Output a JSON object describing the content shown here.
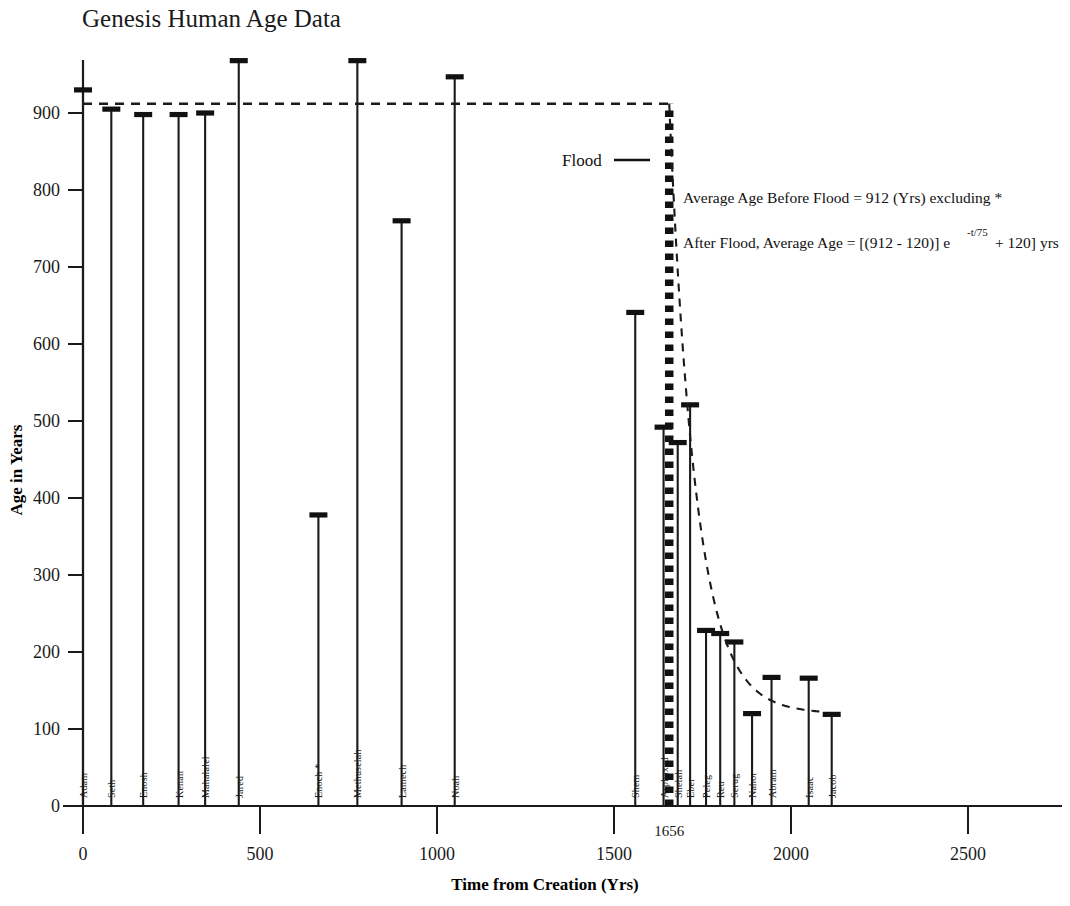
{
  "chart_data": {
    "type": "bar",
    "title": "Genesis Human Age Data",
    "xlabel": "Time from Creation (Yrs)",
    "ylabel": "Age in Years",
    "xlim": [
      0,
      2700
    ],
    "ylim": [
      0,
      1000
    ],
    "grid": false,
    "legend": "none",
    "x_ticks": [
      0,
      500,
      1000,
      1500,
      2000,
      2500
    ],
    "x_tick_labels": [
      "0",
      "500",
      "1000",
      "1500",
      "2000",
      "2500"
    ],
    "x_special_tick": {
      "value": 1656,
      "label": "1656"
    },
    "y_ticks": [
      0,
      100,
      200,
      300,
      400,
      500,
      600,
      700,
      800,
      900
    ],
    "y_tick_labels": [
      "0",
      "100",
      "200",
      "300",
      "400",
      "500",
      "600",
      "700",
      "800",
      "900"
    ],
    "categories": [
      "Adam",
      "Seth",
      "Enosh",
      "Kenan",
      "Mahalalel",
      "Jared",
      "Enoch *",
      "Methuselah",
      "Lamech",
      "Noah",
      "Shem",
      "Arphaxad",
      "Shelah",
      "Eber",
      "Peleg",
      "Reu",
      "Serug",
      "Nahor",
      "Abram",
      "Isaac",
      "Jacob"
    ],
    "values": [
      930,
      905,
      898,
      898,
      900,
      968,
      378,
      968,
      760,
      947,
      641,
      492,
      472,
      521,
      228,
      224,
      213,
      120,
      167,
      166,
      119
    ],
    "x": [
      0,
      80,
      170,
      270,
      345,
      440,
      665,
      775,
      900,
      1050,
      1560,
      1640,
      1680,
      1715,
      1760,
      1800,
      1840,
      1890,
      1945,
      2050,
      2115
    ],
    "points": [
      {
        "name": "Adam",
        "x": 0,
        "age": 930
      },
      {
        "name": "Seth",
        "x": 80,
        "age": 905
      },
      {
        "name": "Enosh",
        "x": 170,
        "age": 898
      },
      {
        "name": "Kenan",
        "x": 270,
        "age": 898
      },
      {
        "name": "Mahalalel",
        "x": 345,
        "age": 900
      },
      {
        "name": "Jared",
        "x": 440,
        "age": 968
      },
      {
        "name": "Enoch *",
        "x": 665,
        "age": 378
      },
      {
        "name": "Methuselah",
        "x": 775,
        "age": 968
      },
      {
        "name": "Lamech",
        "x": 900,
        "age": 760
      },
      {
        "name": "Noah",
        "x": 1050,
        "age": 947
      },
      {
        "name": "Shem",
        "x": 1560,
        "age": 641
      },
      {
        "name": "Arphaxad",
        "x": 1640,
        "age": 492
      },
      {
        "name": "Shelah",
        "x": 1680,
        "age": 472
      },
      {
        "name": "Eber",
        "x": 1715,
        "age": 521
      },
      {
        "name": "Peleg",
        "x": 1760,
        "age": 228
      },
      {
        "name": "Reu",
        "x": 1800,
        "age": 224
      },
      {
        "name": "Serug",
        "x": 1840,
        "age": 213
      },
      {
        "name": "Nahor",
        "x": 1890,
        "age": 120
      },
      {
        "name": "Abram",
        "x": 1945,
        "age": 167
      },
      {
        "name": "Isaac",
        "x": 2050,
        "age": 166
      },
      {
        "name": "Jacob",
        "x": 2115,
        "age": 119
      }
    ],
    "reference_lines": [
      {
        "name": "average-age-before-flood",
        "orientation": "horizontal",
        "value": 912,
        "style": "dashed",
        "x_from": 0,
        "x_to": 1656
      },
      {
        "name": "flood-line",
        "orientation": "vertical",
        "value": 1656,
        "style": "thick-dotted",
        "y_from": 0,
        "y_to": 912
      }
    ],
    "curve": {
      "name": "post-flood-decay",
      "formula": "(912 - 120) * exp(-t/75) + 120",
      "style": "dashed",
      "t_start": 1656,
      "t_end": 2100
    },
    "annotations": [
      {
        "name": "flood-label",
        "text": "Flood"
      },
      {
        "name": "avg-before-flood-note",
        "text": "Average Age Before Flood = 912 (Yrs) excluding *"
      },
      {
        "name": "after-flood-formula-part1",
        "text": "After Flood, Average Age = [(912 - 120)] e"
      },
      {
        "name": "after-flood-formula-exponent",
        "text": "-t/75"
      },
      {
        "name": "after-flood-formula-part2",
        "text": "+ 120] yrs"
      }
    ]
  },
  "annotations": {
    "flood_label": "Flood",
    "note_average": "Average Age Before Flood = 912 (Yrs) excluding *",
    "formula_lead": "After Flood, Average Age = [(912 - 120)] e",
    "formula_exponent": "-t/75",
    "formula_tail": "+ 120] yrs"
  }
}
